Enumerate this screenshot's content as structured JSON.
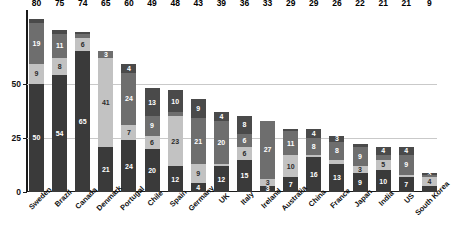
{
  "chart_data": {
    "type": "bar",
    "title": "",
    "xlabel": "",
    "ylabel": "",
    "ylim": [
      0,
      84
    ],
    "yticks": [
      0,
      25,
      50
    ],
    "grid": true,
    "stacked": true,
    "legend": "none",
    "categories": [
      "Sweden",
      "Brazil",
      "Canada",
      "Denmark",
      "Portugal",
      "Chile",
      "Spain",
      "Germany",
      "UK",
      "Italy",
      "Ireland",
      "Australia",
      "China",
      "France",
      "Japan",
      "India",
      "US",
      "South Korea"
    ],
    "totals": [
      80,
      75,
      74,
      65,
      60,
      49,
      48,
      43,
      39,
      36,
      33,
      29,
      29,
      26,
      22,
      21,
      21,
      9
    ],
    "series": [
      {
        "name": "segment-1",
        "color": "#3a3a3a",
        "values": [
          50,
          54,
          65,
          21,
          24,
          20,
          12,
          4,
          12,
          15,
          3,
          7,
          16,
          13,
          9,
          10,
          7,
          3
        ]
      },
      {
        "name": "segment-2",
        "color": "#c2c2c2",
        "values": [
          9,
          8,
          6,
          41,
          7,
          6,
          23,
          9,
          1,
          6,
          3,
          10,
          1,
          2,
          3,
          5,
          1,
          4
        ]
      },
      {
        "name": "segment-3",
        "color": "#6e6e6e",
        "values": [
          19,
          11,
          2,
          3,
          24,
          9,
          2,
          21,
          20,
          6,
          27,
          11,
          8,
          8,
          9,
          2,
          9,
          1
        ]
      },
      {
        "name": "segment-4",
        "color": "#4a4a4a",
        "values": [
          2,
          2,
          1,
          0,
          4,
          13,
          10,
          9,
          4,
          8,
          0,
          1,
          4,
          3,
          1,
          4,
          4,
          1
        ]
      }
    ],
    "segment_labels": [
      [
        "50",
        "9",
        "19",
        ""
      ],
      [
        "54",
        "8",
        "11",
        ""
      ],
      [
        "65",
        "6",
        "",
        ""
      ],
      [
        "21",
        "41",
        "3",
        ""
      ],
      [
        "24",
        "7",
        "24",
        "4"
      ],
      [
        "20",
        "6",
        "9",
        "13"
      ],
      [
        "12",
        "23",
        "",
        "10"
      ],
      [
        "4",
        "9",
        "21",
        "9"
      ],
      [
        "12",
        "",
        "20",
        "4"
      ],
      [
        "15",
        "6",
        "6",
        "8"
      ],
      [
        "3",
        "3",
        "27",
        ""
      ],
      [
        "7",
        "10",
        "11",
        ""
      ],
      [
        "16",
        "",
        "8",
        "4"
      ],
      [
        "13",
        "",
        "8",
        "3"
      ],
      [
        "9",
        "3",
        "9",
        ""
      ],
      [
        "10",
        "5",
        "",
        "4"
      ],
      [
        "7",
        "",
        "9",
        "4"
      ],
      [
        "",
        "4",
        "",
        "3"
      ]
    ]
  },
  "axis": {
    "ytick_labels": [
      "0",
      "25",
      "50"
    ]
  }
}
